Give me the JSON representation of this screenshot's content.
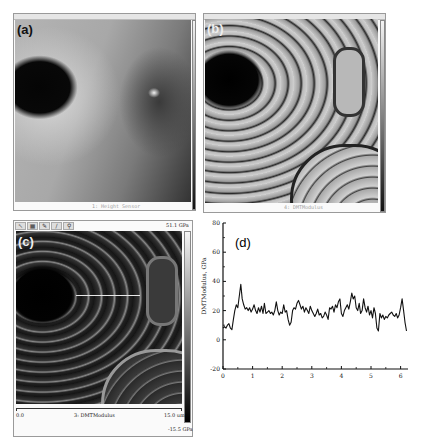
{
  "figure": {
    "panels": [
      {
        "id": "a",
        "label": "(a)",
        "description": "AFM height image",
        "footer_label": "1: Height Sensor"
      },
      {
        "id": "b",
        "label": "(b)",
        "description": "AFM DMT modulus image",
        "footer_label": "4: DMTModulus"
      },
      {
        "id": "c",
        "label": "(c)",
        "description": "AFM DMT modulus image with section line",
        "colorbar_max": "51.1 GPa",
        "colorbar_min": "-15.5 GPa",
        "scale_start": "0.0",
        "scale_end": "15.0 um",
        "channel_label": "3: DMTModulus",
        "toolbar_icons": [
          "pointer-icon",
          "grid-icon",
          "pencil-icon",
          "line-icon",
          "zoom-icon"
        ]
      },
      {
        "id": "d",
        "label": "(d)",
        "description": "Modulus line profile"
      }
    ]
  },
  "chart_data": {
    "type": "line",
    "title": "",
    "panel_label": "(d)",
    "xlabel": "",
    "ylabel": "DMTModulus, GPa",
    "xlim": [
      0,
      6.2
    ],
    "ylim": [
      -20,
      80
    ],
    "xticks": [
      0,
      1,
      2,
      3,
      4,
      5,
      6
    ],
    "yticks": [
      -20,
      0,
      20,
      40,
      60,
      80
    ],
    "grid": false,
    "legend": null,
    "series": [
      {
        "name": "DMTModulus profile",
        "x": [
          0,
          0.05,
          0.1,
          0.15,
          0.2,
          0.25,
          0.3,
          0.35,
          0.4,
          0.45,
          0.5,
          0.55,
          0.6,
          0.65,
          0.7,
          0.75,
          0.8,
          0.85,
          0.9,
          0.95,
          1.0,
          1.05,
          1.1,
          1.15,
          1.2,
          1.25,
          1.3,
          1.35,
          1.4,
          1.45,
          1.5,
          1.55,
          1.6,
          1.65,
          1.7,
          1.75,
          1.8,
          1.85,
          1.9,
          1.95,
          2.0,
          2.05,
          2.1,
          2.15,
          2.2,
          2.25,
          2.3,
          2.35,
          2.4,
          2.45,
          2.5,
          2.55,
          2.6,
          2.65,
          2.7,
          2.75,
          2.8,
          2.85,
          2.9,
          2.95,
          3.0,
          3.05,
          3.1,
          3.15,
          3.2,
          3.25,
          3.3,
          3.35,
          3.4,
          3.45,
          3.5,
          3.55,
          3.6,
          3.65,
          3.7,
          3.75,
          3.8,
          3.85,
          3.9,
          3.95,
          4.0,
          4.05,
          4.1,
          4.15,
          4.2,
          4.25,
          4.3,
          4.35,
          4.4,
          4.45,
          4.5,
          4.55,
          4.6,
          4.65,
          4.7,
          4.75,
          4.8,
          4.85,
          4.9,
          4.95,
          5.0,
          5.05,
          5.1,
          5.15,
          5.2,
          5.25,
          5.3,
          5.35,
          5.4,
          5.45,
          5.5,
          5.55,
          5.6,
          5.65,
          5.7,
          5.75,
          5.8,
          5.85,
          5.9,
          5.95,
          6.0,
          6.05,
          6.1,
          6.15,
          6.2
        ],
        "y": [
          8,
          9,
          8,
          10,
          11,
          8,
          7,
          14,
          20,
          24,
          22,
          30,
          38,
          28,
          24,
          21,
          22,
          20,
          22,
          19,
          21,
          24,
          20,
          18,
          22,
          19,
          23,
          18,
          25,
          18,
          19,
          20,
          18,
          19,
          17,
          20,
          26,
          20,
          17,
          19,
          18,
          24,
          19,
          20,
          14,
          10,
          12,
          20,
          22,
          21,
          25,
          27,
          24,
          21,
          23,
          19,
          22,
          20,
          18,
          23,
          20,
          18,
          16,
          18,
          21,
          17,
          18,
          15,
          16,
          19,
          17,
          14,
          22,
          21,
          23,
          19,
          24,
          22,
          26,
          28,
          18,
          16,
          20,
          22,
          24,
          21,
          26,
          32,
          28,
          30,
          22,
          20,
          25,
          18,
          20,
          28,
          22,
          19,
          23,
          17,
          20,
          15,
          22,
          18,
          8,
          6,
          18,
          15,
          17,
          14,
          16,
          15,
          17,
          18,
          19,
          17,
          16,
          18,
          15,
          17,
          22,
          28,
          20,
          12,
          6
        ]
      }
    ]
  }
}
